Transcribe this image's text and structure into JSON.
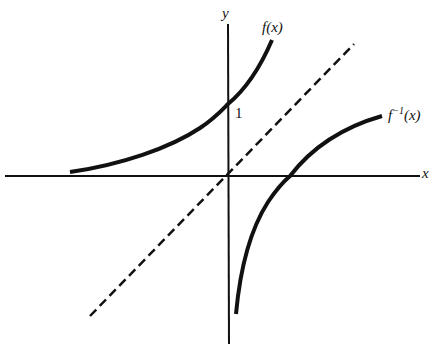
{
  "diagram": {
    "title": "",
    "axes": {
      "x_label": "x",
      "y_label": "y",
      "y_intercept_label": "1"
    },
    "curves": [
      {
        "id": "f",
        "label_base": "f",
        "label_sup": "",
        "label_arg": "(x)",
        "style": "solid",
        "kind": "exponential e^x"
      },
      {
        "id": "f_inverse",
        "label_base": "f",
        "label_sup": "−1",
        "label_arg": "(x)",
        "style": "solid",
        "kind": "logarithm ln x"
      },
      {
        "id": "identity",
        "label": "y = x",
        "style": "dashed"
      }
    ],
    "colors": {
      "ink": "#111111",
      "background": "#ffffff"
    }
  }
}
